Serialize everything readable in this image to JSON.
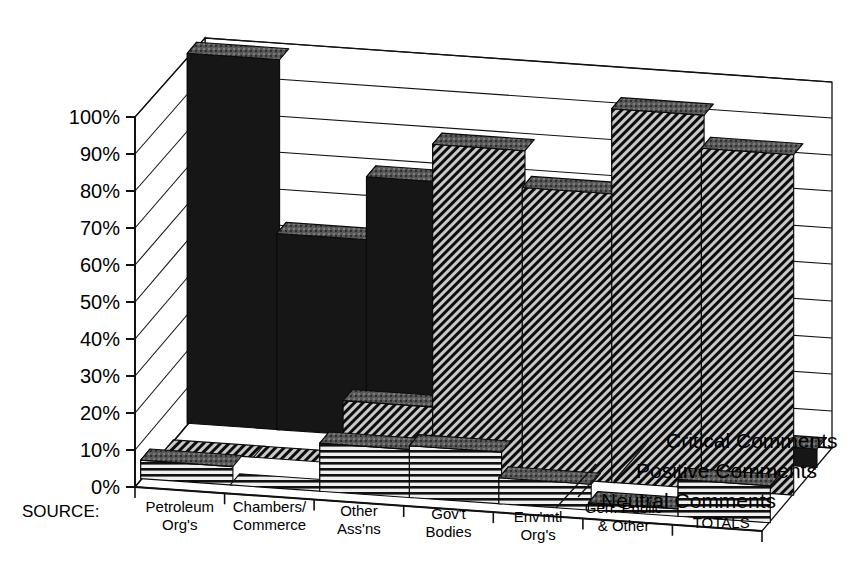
{
  "chart_data": {
    "type": "bar",
    "render": "3d-grouped-bar",
    "title": "",
    "subtitle": "",
    "xlabel": "SOURCE:",
    "ylabel": "",
    "ylim": [
      0,
      100
    ],
    "yunit": "%",
    "ytick_labels": [
      "0%",
      "10%",
      "20%",
      "30%",
      "40%",
      "50%",
      "60%",
      "70%",
      "80%",
      "90%",
      "100%"
    ],
    "ytick_values": [
      0,
      10,
      20,
      30,
      40,
      50,
      60,
      70,
      80,
      90,
      100
    ],
    "grid": true,
    "legend_position": "right-depth-axis",
    "categories": [
      "Petroleum Org's",
      "Chambers/ Commerce",
      "Other Ass'ns",
      "Gov't Bodies",
      "Env'mtl Org's",
      "Gen. Public & Other",
      "TOTALS"
    ],
    "category_lines": [
      [
        "Petroleum",
        "Org's"
      ],
      [
        "Chambers/",
        "Commerce"
      ],
      [
        "Other",
        "Ass'ns"
      ],
      [
        "Gov't",
        "Bodies"
      ],
      [
        "Env'mtl",
        "Org's"
      ],
      [
        "Gen. Public",
        "& Other"
      ],
      [
        "TOTALS",
        ""
      ]
    ],
    "series": [
      {
        "name": "Critical Comments",
        "pattern": "solid-black",
        "depth_row": "back",
        "values": [
          100,
          53,
          70,
          30,
          13,
          8,
          5
        ]
      },
      {
        "name": "Positive Comments",
        "pattern": "diagonal-hatch",
        "depth_row": "middle",
        "values": [
          0,
          0,
          17,
          88,
          78,
          101,
          92
        ]
      },
      {
        "name": "Neutral Comments",
        "pattern": "horizontal-stripes",
        "depth_row": "front",
        "values": [
          5,
          0,
          13,
          14,
          7,
          2,
          10
        ]
      }
    ],
    "legend": [
      {
        "label": "Critical Comments",
        "pattern": "solid-black"
      },
      {
        "label": "Positive Comments",
        "pattern": "diagonal-hatch"
      },
      {
        "label": "Neutral Comments",
        "pattern": "horizontal-stripes"
      }
    ],
    "colors": {
      "background": "#ffffff",
      "axis": "#000000",
      "grid": "#1a1a1a",
      "bar_solid": "#1a1a1a",
      "bar_hatch_fg": "#111111",
      "bar_hatch_bg": "#d9d9d9",
      "bar_stripe_fg": "#111111",
      "bar_stripe_bg": "#e6e6e6",
      "bar_top_face": "#4a4a4a",
      "bar_side_face": "#6b6b6b"
    }
  }
}
